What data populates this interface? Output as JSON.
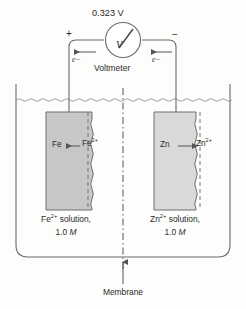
{
  "figure": {
    "background_color": "#fdfdfc",
    "line_color": "#555555"
  },
  "meter": {
    "voltage_reading": "0.323 V",
    "device_label": "Voltmeter",
    "symbol": "V",
    "terminal_positive": "+",
    "terminal_negative": "−",
    "electron_left": "e−",
    "electron_right": "e−",
    "needle_angle_deg": -38
  },
  "left_half_cell": {
    "metal_label": "Fe",
    "ion_label": "Fe",
    "ion_charge": "2+",
    "solution_line_1": "solution,",
    "solution_prefix": "Fe",
    "solution_charge": "2+",
    "concentration_value": "1.0",
    "concentration_unit": "M",
    "electrode_color": "#c7c7c7",
    "electrode_border": "#6e6e6e",
    "reaction_direction": "ion-to-metal"
  },
  "right_half_cell": {
    "metal_label": "Zn",
    "ion_label": "Zn",
    "ion_charge": "2+",
    "solution_line_1": "solution,",
    "solution_prefix": "Zn",
    "solution_charge": "2+",
    "concentration_value": "1.0",
    "concentration_unit": "M",
    "electrode_color": "#d9d9d9",
    "electrode_border": "#6e6e6e",
    "reaction_direction": "metal-to-ion"
  },
  "membrane": {
    "label": "Membrane",
    "style": "dash-dot vertical line"
  },
  "beaker": {
    "waterline_style": "wavy",
    "corner_radius": 12
  }
}
